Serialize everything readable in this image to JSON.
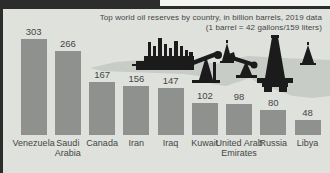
{
  "chart_data": {
    "type": "bar",
    "title": "Top world oil reserves by country, in billion barrels, 2019 data",
    "subtitle": "(1 barrel = 42 gallons/159 liters)",
    "categories": [
      "Venezuela",
      "Saudi Arabia",
      "Canada",
      "Iran",
      "Iraq",
      "Kuwait",
      "United Arab Emirates",
      "Russia",
      "Libya"
    ],
    "values": [
      303,
      266,
      167,
      156,
      147,
      102,
      98,
      80,
      48
    ],
    "xlabel": "",
    "ylabel": "",
    "ylim": [
      0,
      310
    ],
    "grid": false,
    "legend": "none",
    "value_labels_shown": true
  },
  "illustration": {
    "icons": [
      "refinery-icon",
      "pumpjack-icon",
      "derrick-icon",
      "pumpjack-icon",
      "oil-rig-icon",
      "derrick-icon"
    ]
  },
  "colors": {
    "background": "#dfe1dd",
    "bar": "#8e918e",
    "frame": "#2c2c2c",
    "land": "#c7ccc6",
    "silhouette": "#1b1b1b",
    "text": "#454545",
    "top_right_strip": "#f3f4f2"
  }
}
